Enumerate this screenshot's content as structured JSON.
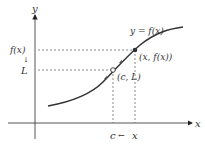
{
  "diagram": {
    "axes": {
      "x_label": "x",
      "y_label": "y"
    },
    "curve_label": "y = f(x)",
    "left_labels": {
      "fx": "f(x)",
      "arrow": "↓",
      "L": "L"
    },
    "points": {
      "moving": {
        "label": "(x, f(x))",
        "style": "filled"
      },
      "limit": {
        "label": "(c, L)",
        "style": "open"
      }
    },
    "bottom_labels": {
      "c": "c",
      "arrow": "←",
      "x": "x"
    },
    "colors": {
      "curve": "#333333",
      "axis": "#333333",
      "dashed": "#555555",
      "background": "#ffffff"
    }
  }
}
